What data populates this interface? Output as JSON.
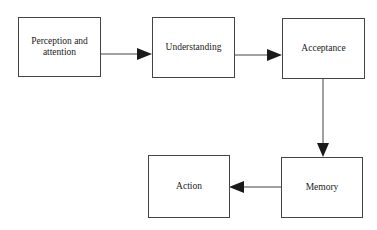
{
  "diagram": {
    "type": "flowchart",
    "nodes": [
      {
        "id": "perception",
        "label": "Perception and\nattention",
        "line1": "Perception and",
        "line2": "attention"
      },
      {
        "id": "understanding",
        "label": "Understanding"
      },
      {
        "id": "acceptance",
        "label": "Acceptance"
      },
      {
        "id": "memory",
        "label": "Memory"
      },
      {
        "id": "action",
        "label": "Action"
      }
    ],
    "edges": [
      {
        "from": "perception",
        "to": "understanding"
      },
      {
        "from": "understanding",
        "to": "acceptance"
      },
      {
        "from": "acceptance",
        "to": "memory"
      },
      {
        "from": "memory",
        "to": "action"
      }
    ],
    "colors": {
      "stroke": "#444444",
      "arrow": "#1a1a1a",
      "background": "#ffffff"
    }
  }
}
